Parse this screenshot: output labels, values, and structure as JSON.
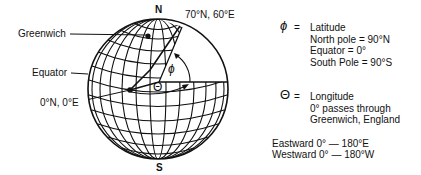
{
  "diagram": {
    "labels": {
      "north": "N",
      "south": "S",
      "point_label": "70°N, 60°E",
      "greenwich": "Greenwich",
      "equator": "Equator",
      "origin": "0°N, 0°E",
      "phi_symbol": "ϕ",
      "theta_symbol": "Θ"
    },
    "legend": {
      "latitude": {
        "symbol": "ϕ",
        "equals": "=",
        "title": "Latitude",
        "lines": [
          "North pole = 90°N",
          "Equator = 0°",
          "South Pole = 90°S"
        ]
      },
      "longitude": {
        "symbol": "Θ",
        "equals": "=",
        "title": "Longitude",
        "lines": [
          "0° passes through",
          "Greenwich, England"
        ]
      },
      "ranges": [
        "Eastward 0° — 180°E",
        "Westward 0° — 180°W"
      ]
    },
    "colors": {
      "line": "#111111",
      "background": "#ffffff"
    }
  }
}
